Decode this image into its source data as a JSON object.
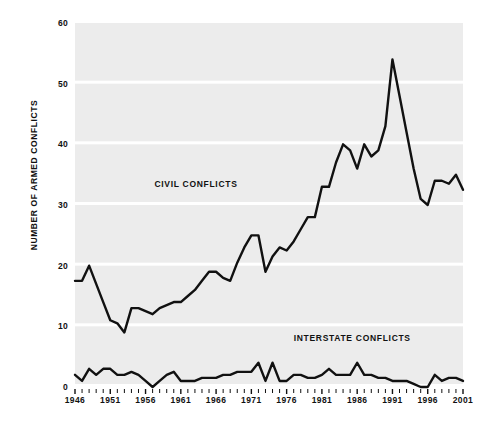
{
  "chart_data": {
    "type": "line",
    "title": "",
    "xlabel": "",
    "ylabel": "NUMBER OF ARMED CONFLICTS",
    "ylim": [
      0,
      60
    ],
    "xlim": [
      1946,
      2001
    ],
    "yticks": [
      0,
      10,
      20,
      30,
      40,
      50,
      60
    ],
    "ytick_labels": [
      "0",
      "10",
      "20",
      "30",
      "40",
      "50",
      "60"
    ],
    "xticks": [
      1946,
      1951,
      1956,
      1961,
      1966,
      1971,
      1976,
      1981,
      1986,
      1991,
      1996,
      2001
    ],
    "xtick_labels": [
      "1946",
      "1951",
      "1956",
      "1961",
      "1966",
      "1971",
      "1976",
      "1981",
      "1986",
      "1991",
      "1996",
      "2001"
    ],
    "x": [
      1946,
      1947,
      1948,
      1949,
      1950,
      1951,
      1952,
      1953,
      1954,
      1955,
      1956,
      1957,
      1958,
      1959,
      1960,
      1961,
      1962,
      1963,
      1964,
      1965,
      1966,
      1967,
      1968,
      1969,
      1970,
      1971,
      1972,
      1973,
      1974,
      1975,
      1976,
      1977,
      1978,
      1979,
      1980,
      1981,
      1982,
      1983,
      1984,
      1985,
      1986,
      1987,
      1988,
      1989,
      1990,
      1991,
      1992,
      1993,
      1994,
      1995,
      1996,
      1997,
      1998,
      1999,
      2000,
      2001
    ],
    "grid": true,
    "legend_position": "inline",
    "series": [
      {
        "name": "CIVIL CONFLICTS",
        "color": "#111111",
        "values": [
          17.5,
          17.5,
          20,
          17,
          14,
          11,
          10.5,
          9,
          13,
          13,
          12.5,
          12,
          13,
          13.5,
          14,
          14,
          15,
          16,
          17.5,
          19,
          19,
          18,
          17.5,
          20.5,
          23,
          25,
          25,
          19,
          21.5,
          23,
          22.5,
          24,
          26,
          28,
          28,
          33,
          33,
          37,
          40,
          39,
          36,
          40,
          38,
          39,
          43,
          54,
          48,
          42,
          36,
          31,
          30,
          34,
          34,
          33.5,
          35,
          32.5
        ]
      },
      {
        "name": "INTERSTATE CONFLICTS",
        "color": "#111111",
        "values": [
          2,
          1,
          3,
          2,
          3,
          3,
          2,
          2,
          2.5,
          2,
          1,
          0,
          1,
          2,
          2.5,
          1,
          1,
          1,
          1.5,
          1.5,
          1.5,
          2,
          2,
          2.5,
          2.5,
          2.5,
          4,
          1,
          4,
          1,
          1,
          2,
          2,
          1.5,
          1.5,
          2,
          3,
          2,
          2,
          2,
          4,
          2,
          2,
          1.5,
          1.5,
          1,
          1,
          1,
          0.5,
          0,
          0,
          2,
          1,
          1.5,
          1.5,
          1
        ]
      }
    ],
    "annotations": [
      {
        "text": "CIVIL CONFLICTS",
        "x": 1963.5,
        "y": 33.5
      },
      {
        "text": "INTERSTATE CONFLICTS",
        "x": 1985.5,
        "y": 8
      }
    ]
  },
  "style": {
    "band_color": "#ececec",
    "gridline_color": "#ffffff",
    "line_color": "#111111",
    "text_color": "#111111",
    "page_background": "#ffffff"
  },
  "labels": {
    "civil": "CIVIL CONFLICTS",
    "interstate": "INTERSTATE CONFLICTS"
  }
}
